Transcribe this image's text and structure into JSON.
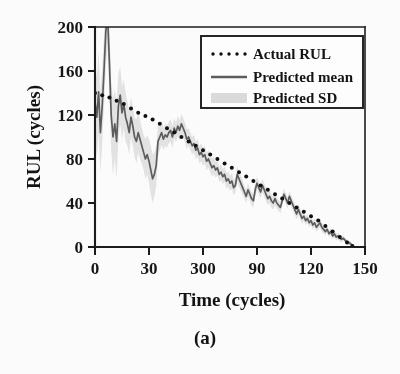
{
  "figure": {
    "caption": "(a)",
    "background_color": "#fdfdfd"
  },
  "chart_data": {
    "type": "line",
    "title": "",
    "subtitle": "",
    "caption": "(a)",
    "xlabel": "Time (cycles)",
    "ylabel": "RUL (cycles)",
    "xlim": [
      0,
      150
    ],
    "ylim": [
      0,
      200
    ],
    "xticks": [
      0,
      30,
      60,
      90,
      120,
      150
    ],
    "xticklabels": [
      "0",
      "30",
      "300",
      "90",
      "120",
      "150"
    ],
    "yticks": [
      0,
      40,
      80,
      120,
      160,
      200
    ],
    "yticklabels": [
      "0",
      "40",
      "80",
      "120",
      "160",
      "200"
    ],
    "grid": false,
    "legend_position": "upper right",
    "colors": {
      "actual": "#101010",
      "mean": "#5d5d5d",
      "sd_band": "#d9d9d9",
      "axis": "#1c1c1c"
    },
    "legend": [
      {
        "label": "Actual RUL",
        "style": "dotted",
        "color": "#101010"
      },
      {
        "label": "Predicted mean",
        "style": "solid",
        "color": "#5d5d5d"
      },
      {
        "label": "Predicted SD",
        "style": "band",
        "color": "#d9d9d9"
      }
    ],
    "series": [
      {
        "name": "Actual RUL",
        "style": "dotted",
        "x": [
          0,
          4,
          8,
          12,
          16,
          20,
          24,
          28,
          32,
          36,
          40,
          44,
          48,
          52,
          56,
          60,
          64,
          68,
          72,
          76,
          80,
          84,
          88,
          92,
          96,
          100,
          104,
          108,
          112,
          116,
          120,
          124,
          128,
          132,
          136,
          140,
          143
        ],
        "y": [
          140,
          138,
          136,
          133,
          130,
          126,
          122,
          119,
          116,
          112,
          108,
          104,
          100,
          96,
          92,
          88,
          84,
          80,
          76,
          72,
          68,
          64,
          60,
          56,
          52,
          48,
          44,
          40,
          36,
          32,
          28,
          24,
          19,
          14,
          9,
          4,
          1
        ]
      },
      {
        "name": "Predicted mean",
        "style": "solid",
        "x": [
          0,
          1,
          2,
          3,
          4,
          5,
          6,
          7,
          8,
          9,
          10,
          11,
          12,
          13,
          14,
          15,
          16,
          17,
          18,
          19,
          20,
          21,
          22,
          23,
          24,
          25,
          26,
          27,
          28,
          29,
          30,
          31,
          32,
          33,
          34,
          35,
          36,
          37,
          38,
          39,
          40,
          41,
          42,
          43,
          44,
          45,
          46,
          47,
          48,
          49,
          50,
          51,
          52,
          53,
          54,
          55,
          56,
          57,
          58,
          59,
          60,
          61,
          62,
          63,
          64,
          65,
          66,
          67,
          68,
          69,
          70,
          71,
          72,
          73,
          74,
          75,
          76,
          77,
          78,
          79,
          80,
          81,
          82,
          83,
          84,
          85,
          86,
          87,
          88,
          89,
          90,
          91,
          92,
          93,
          94,
          95,
          96,
          97,
          98,
          99,
          100,
          101,
          102,
          103,
          104,
          105,
          106,
          107,
          108,
          109,
          110,
          111,
          112,
          113,
          114,
          115,
          116,
          117,
          118,
          119,
          120,
          121,
          122,
          123,
          124,
          125,
          126,
          127,
          128,
          129,
          130,
          131,
          132,
          133,
          134,
          135,
          136,
          137,
          138,
          139,
          140,
          141,
          142,
          143
        ],
        "y": [
          132,
          118,
          141,
          104,
          128,
          160,
          196,
          210,
          168,
          120,
          100,
          112,
          96,
          128,
          138,
          122,
          130,
          118,
          112,
          104,
          118,
          110,
          100,
          96,
          104,
          98,
          92,
          86,
          80,
          84,
          78,
          70,
          62,
          66,
          74,
          96,
          100,
          104,
          98,
          102,
          100,
          104,
          106,
          100,
          108,
          104,
          110,
          106,
          112,
          108,
          104,
          98,
          100,
          96,
          92,
          94,
          88,
          90,
          84,
          86,
          82,
          84,
          78,
          80,
          76,
          72,
          74,
          70,
          72,
          66,
          68,
          64,
          66,
          60,
          62,
          58,
          60,
          54,
          56,
          66,
          62,
          58,
          54,
          50,
          46,
          52,
          48,
          44,
          42,
          52,
          58,
          54,
          50,
          56,
          52,
          48,
          44,
          46,
          42,
          40,
          44,
          40,
          38,
          36,
          42,
          48,
          44,
          40,
          46,
          42,
          38,
          34,
          30,
          34,
          30,
          26,
          28,
          24,
          26,
          22,
          24,
          20,
          22,
          18,
          20,
          22,
          18,
          16,
          14,
          16,
          12,
          14,
          10,
          12,
          9,
          10,
          8,
          7,
          8,
          6,
          5,
          4,
          3,
          1
        ]
      },
      {
        "name": "Predicted SD",
        "style": "band",
        "x": [
          0,
          1,
          2,
          3,
          4,
          5,
          6,
          7,
          8,
          9,
          10,
          11,
          12,
          13,
          14,
          15,
          16,
          17,
          18,
          19,
          20,
          21,
          22,
          23,
          24,
          25,
          26,
          27,
          28,
          29,
          30,
          31,
          32,
          33,
          34,
          35,
          36,
          37,
          38,
          39,
          40,
          41,
          42,
          43,
          44,
          45,
          46,
          47,
          48,
          49,
          50,
          51,
          52,
          53,
          54,
          55,
          56,
          57,
          58,
          59,
          60,
          61,
          62,
          63,
          64,
          65,
          66,
          67,
          68,
          69,
          70,
          71,
          72,
          73,
          74,
          75,
          76,
          77,
          78,
          79,
          80,
          81,
          82,
          83,
          84,
          85,
          86,
          87,
          88,
          89,
          90,
          91,
          92,
          93,
          94,
          95,
          96,
          97,
          98,
          99,
          100,
          101,
          102,
          103,
          104,
          105,
          106,
          107,
          108,
          109,
          110,
          111,
          112,
          113,
          114,
          115,
          116,
          117,
          118,
          119,
          120,
          121,
          122,
          123,
          124,
          125,
          126,
          127,
          128,
          129,
          130,
          131,
          132,
          133,
          134,
          135,
          136,
          137,
          138,
          139,
          140,
          141,
          142,
          143
        ],
        "sd": [
          34,
          36,
          38,
          36,
          34,
          32,
          30,
          28,
          30,
          32,
          34,
          32,
          34,
          30,
          26,
          24,
          22,
          22,
          20,
          20,
          18,
          18,
          18,
          20,
          18,
          18,
          16,
          16,
          18,
          18,
          20,
          22,
          22,
          20,
          18,
          14,
          12,
          11,
          10,
          10,
          10,
          10,
          10,
          10,
          9,
          9,
          9,
          9,
          9,
          9,
          9,
          9,
          8,
          8,
          8,
          8,
          8,
          8,
          8,
          8,
          8,
          8,
          8,
          8,
          8,
          8,
          8,
          7,
          7,
          7,
          7,
          7,
          7,
          7,
          7,
          7,
          7,
          7,
          7,
          7,
          7,
          7,
          7,
          6,
          6,
          6,
          6,
          6,
          6,
          6,
          6,
          6,
          6,
          6,
          6,
          6,
          6,
          6,
          6,
          6,
          6,
          5,
          5,
          5,
          5,
          5,
          5,
          5,
          5,
          5,
          5,
          5,
          5,
          5,
          5,
          5,
          4,
          4,
          4,
          4,
          4,
          4,
          4,
          4,
          4,
          4,
          4,
          4,
          3,
          3,
          3,
          3,
          3,
          3,
          3,
          3,
          3,
          3,
          2,
          2,
          2,
          2,
          2,
          2
        ]
      }
    ]
  }
}
